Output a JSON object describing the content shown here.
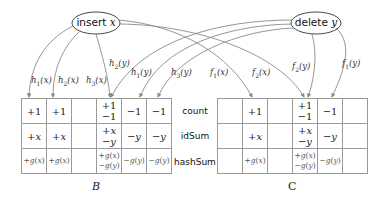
{
  "operations": {
    "insert": {
      "verb": "insert",
      "var": "x"
    },
    "delete": {
      "verb": "delete",
      "var": "y"
    }
  },
  "arrow_labels": {
    "insert_h1": "h1(x)",
    "insert_h2": "h2(x)",
    "insert_h3": "h3(x)",
    "insert_f1": "f1(x)",
    "insert_f2": "f2(x)",
    "delete_h2": "h2(y)",
    "delete_h1": "h1(y)",
    "delete_h3": "h3(y)",
    "delete_f2": "f2(y)",
    "delete_f1": "f1(y)"
  },
  "row_labels": [
    "count",
    "idSum",
    "hashSum"
  ],
  "table_B": {
    "caption": "B",
    "rows": [
      [
        [
          "+1"
        ],
        [
          "+1"
        ],
        [],
        [
          "+1",
          "−1"
        ],
        [
          "−1"
        ],
        [
          "−1"
        ]
      ],
      [
        [
          "+x"
        ],
        [
          "+x"
        ],
        [],
        [
          "+x",
          "−y"
        ],
        [
          "−y"
        ],
        [
          "−y"
        ]
      ],
      [
        [
          "+g(x)"
        ],
        [
          "+g(x)"
        ],
        [],
        [
          "+g(x)",
          "−g(y)"
        ],
        [
          "−g(y)"
        ],
        [
          "−g(y)"
        ]
      ]
    ]
  },
  "table_C": {
    "caption": "C",
    "rows": [
      [
        [],
        [
          "+1"
        ],
        [],
        [
          "+1",
          "−1"
        ],
        [
          "−1"
        ],
        []
      ],
      [
        [],
        [
          "+x"
        ],
        [],
        [
          "+x",
          "−y"
        ],
        [
          "−y"
        ],
        []
      ],
      [
        [],
        [
          "+g(x)"
        ],
        [],
        [
          "+g(x)",
          "−g(y)"
        ],
        [
          "−g(y)"
        ],
        []
      ]
    ]
  },
  "colors": {
    "arrow": "#8a8a8a",
    "grid": "#9a9a9a",
    "text": "#222222"
  }
}
